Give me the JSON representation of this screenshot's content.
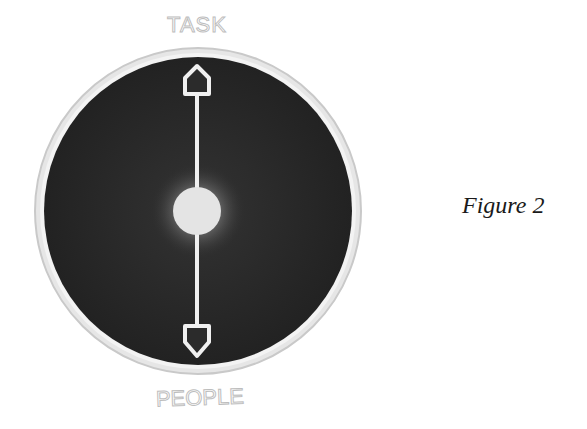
{
  "diagram": {
    "top_label": "TASK",
    "bottom_label": "PEOPLE",
    "colors": {
      "disc": "#2b2b2b",
      "ring": "#d4d4d4",
      "label": "#c8c8c8",
      "arrow": "#f0f0f0",
      "center_dot": "#e8e8e8"
    },
    "elements": {
      "disc": "dark circular field",
      "axis": "double-headed vertical arrow",
      "center": "glowing center dot"
    }
  },
  "caption": "Figure 2"
}
